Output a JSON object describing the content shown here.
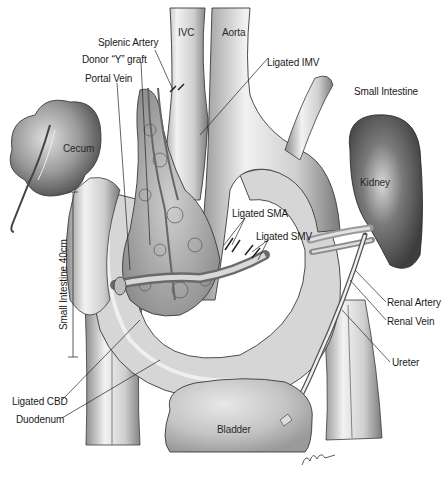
{
  "figure": {
    "type": "surgical anatomical illustration",
    "labels": {
      "ivc": "IVC",
      "aorta": "Aorta",
      "splenic_artery": "Splenic Artery",
      "donor_y_graft": "Donor “Y” graft",
      "portal_vein": "Portal Vein",
      "ligated_imv": "Ligated IMV",
      "small_intestine_top": "Small Intestine",
      "cecum": "Cecum",
      "kidney": "Kidney",
      "ligated_sma": "Ligated SMA",
      "ligated_smv": "Ligated SMV",
      "small_intestine_length": "Small Intestine 40cm",
      "renal_artery": "Renal Artery",
      "renal_vein": "Renal Vein",
      "ureter": "Ureter",
      "ligated_cbd": "Ligated CBD",
      "duodenum": "Duodenum",
      "bladder": "Bladder",
      "signature": "M.Tolbert"
    },
    "colors": {
      "background": "#ffffff",
      "tissue_light": "#e6e6e6",
      "tissue_mid": "#bdbdbd",
      "tissue_dark": "#6e6e6e",
      "kidney_dark": "#555555",
      "outline": "#3a3a3a",
      "leader_line": "#222222"
    }
  }
}
